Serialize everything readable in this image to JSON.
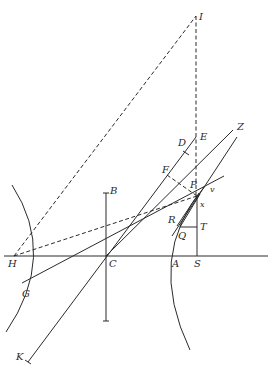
{
  "diagram": {
    "title": "",
    "colors": {
      "ink": "#2a2a2a",
      "background": "#ffffff"
    },
    "labels": {
      "I": "I",
      "E": "E",
      "D": "D",
      "Z": "Z",
      "F": "F",
      "P": "P",
      "v": "v",
      "x": "x",
      "B": "B",
      "R": "R",
      "Q": "Q",
      "T": "T",
      "H": "H",
      "C": "C",
      "A": "A",
      "S": "S",
      "G": "G",
      "K": "K"
    },
    "elements": [
      "axis-line H–S",
      "conjugate-axis B (vertical through C)",
      "hyperbola-branch left (through H side)",
      "hyperbola-branch right (through A)",
      "dashed line H–I",
      "dashed line I–S (vertical)",
      "dashed line H–P",
      "dashed line F–P",
      "line K–D through C",
      "line G–v through C",
      "line C–Z",
      "line R–Z (tangent)",
      "segment Q–T",
      "segment T–S"
    ]
  }
}
